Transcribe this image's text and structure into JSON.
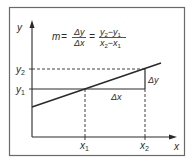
{
  "diagram": {
    "formula": {
      "lhs": "m",
      "eq1": "=",
      "frac1_num": "Δy",
      "frac1_den": "Δx",
      "eq2": "=",
      "frac2_num_a": "y",
      "frac2_num_a_sub": "2",
      "frac2_num_minus": "−",
      "frac2_num_b": "y",
      "frac2_num_b_sub": "1",
      "frac2_den_a": "x",
      "frac2_den_a_sub": "2",
      "frac2_den_minus": "−",
      "frac2_den_b": "x",
      "frac2_den_b_sub": "1"
    },
    "axes": {
      "x_label": "x",
      "y_label": "y"
    },
    "ticks": {
      "y2": {
        "base": "y",
        "sub": "2"
      },
      "y1": {
        "base": "y",
        "sub": "1"
      },
      "x1": {
        "base": "x",
        "sub": "1"
      },
      "x2": {
        "base": "x",
        "sub": "2"
      }
    },
    "annotations": {
      "delta_y": "Δy",
      "delta_x": "Δx"
    },
    "colors": {
      "ink": "#2a2a2a",
      "frame": "#555555",
      "background": "#ffffff"
    }
  }
}
